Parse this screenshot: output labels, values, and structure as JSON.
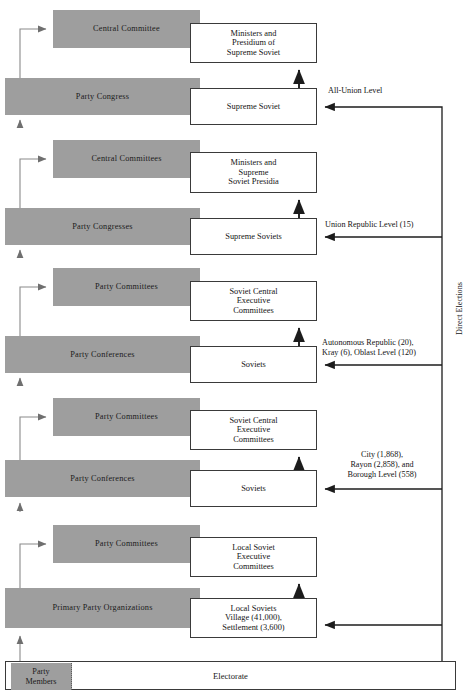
{
  "diagram": {
    "colors": {
      "party_fill": "#9e9e9e",
      "state_fill": "#ffffff",
      "stroke": "#3a3a3a",
      "text": "#141414"
    },
    "party_column": [
      {
        "name": "central-committee",
        "label": "Central Committee",
        "x": 53,
        "y": 10,
        "w": 147,
        "h": 38
      },
      {
        "name": "party-congress",
        "label": "Party Congress",
        "x": 5,
        "y": 78,
        "w": 195,
        "h": 37
      },
      {
        "name": "central-committees",
        "label": "Central Committees",
        "x": 53,
        "y": 140,
        "w": 147,
        "h": 38
      },
      {
        "name": "party-congresses",
        "label": "Party Congresses",
        "x": 5,
        "y": 208,
        "w": 195,
        "h": 37
      },
      {
        "name": "party-committees-oblast",
        "label": "Party Committees",
        "x": 53,
        "y": 268,
        "w": 147,
        "h": 38
      },
      {
        "name": "party-conferences-oblast",
        "label": "Party Conferences",
        "x": 5,
        "y": 336,
        "w": 195,
        "h": 37
      },
      {
        "name": "party-committees-city",
        "label": "Party Committees",
        "x": 53,
        "y": 398,
        "w": 147,
        "h": 38
      },
      {
        "name": "party-conferences-city",
        "label": "Party Conferences",
        "x": 5,
        "y": 460,
        "w": 195,
        "h": 37
      },
      {
        "name": "party-committees-local",
        "label": "Party Committees",
        "x": 53,
        "y": 525,
        "w": 147,
        "h": 38
      },
      {
        "name": "primary-party-organizations",
        "label": "Primary Party Organizations",
        "x": 5,
        "y": 588,
        "w": 195,
        "h": 40
      }
    ],
    "state_column": [
      {
        "name": "ministers-presidium-supreme-soviet",
        "lines": [
          "Ministers and",
          "Presidium of",
          "Supreme Soviet"
        ],
        "x": 190,
        "y": 23,
        "w": 127,
        "h": 40
      },
      {
        "name": "supreme-soviet",
        "lines": [
          "Supreme Soviet"
        ],
        "x": 190,
        "y": 88,
        "w": 127,
        "h": 37
      },
      {
        "name": "ministers-supreme-soviet-presidia",
        "lines": [
          "Ministers and",
          "Supreme",
          "Soviet Presidia"
        ],
        "x": 190,
        "y": 152,
        "w": 127,
        "h": 41
      },
      {
        "name": "supreme-soviets",
        "lines": [
          "Supreme Soviets"
        ],
        "x": 190,
        "y": 218,
        "w": 127,
        "h": 37
      },
      {
        "name": "soviet-central-executive-committees-oblast",
        "lines": [
          "Soviet Central",
          "Executive",
          "Committees"
        ],
        "x": 190,
        "y": 281,
        "w": 127,
        "h": 40
      },
      {
        "name": "soviets-oblast",
        "lines": [
          "Soviets"
        ],
        "x": 190,
        "y": 346,
        "w": 127,
        "h": 37
      },
      {
        "name": "soviet-central-executive-committees-city",
        "lines": [
          "Soviet Central",
          "Executive",
          "Committees"
        ],
        "x": 190,
        "y": 410,
        "w": 127,
        "h": 40
      },
      {
        "name": "soviets-city",
        "lines": [
          "Soviets"
        ],
        "x": 190,
        "y": 470,
        "w": 127,
        "h": 37
      },
      {
        "name": "local-soviet-executive-committees",
        "lines": [
          "Local Soviet",
          "Executive",
          "Committees"
        ],
        "x": 190,
        "y": 537,
        "w": 127,
        "h": 40
      },
      {
        "name": "local-soviets-village-settlement",
        "lines": [
          "Local Soviets",
          "Village (41,000),",
          "Settlement (3,600)"
        ],
        "x": 190,
        "y": 598,
        "w": 127,
        "h": 40
      }
    ],
    "level_labels": [
      {
        "name": "level-all-union",
        "lines": [
          "All-Union Level"
        ],
        "x": 328,
        "y": 86,
        "align": "left"
      },
      {
        "name": "level-union-republic",
        "lines": [
          "Union Republic Level (15)"
        ],
        "x": 325,
        "y": 220,
        "align": "left"
      },
      {
        "name": "level-autonomous",
        "lines": [
          "Autonomous Republic (20),",
          "Kray (6), Oblast Level (120)"
        ],
        "x": 323,
        "y": 339,
        "align": "left"
      },
      {
        "name": "level-city-rayon",
        "lines": [
          "City (1,868),",
          "Rayon (2,858), and",
          "Borough Level (558)"
        ],
        "x": 322,
        "y": 450,
        "align": "center"
      }
    ],
    "vertical_label": {
      "name": "direct-elections-label",
      "text": "Direct Elections"
    },
    "electorate": {
      "name": "electorate-box",
      "label": "Electorate",
      "x": 5,
      "y": 661,
      "w": 451,
      "h": 29
    },
    "party_members": {
      "name": "party-members-box",
      "lines": [
        "Party",
        "Members"
      ],
      "x": 11,
      "y": 663,
      "w": 61,
      "h": 27
    }
  }
}
